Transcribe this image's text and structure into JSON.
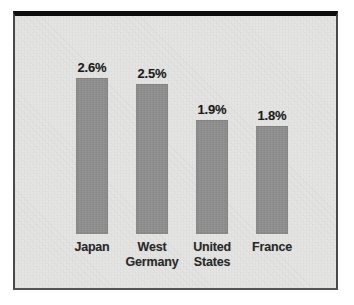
{
  "chart_data": {
    "type": "bar",
    "title": "",
    "subtitle": "",
    "xlabel": "",
    "ylabel": "",
    "grid": false,
    "legend": "none",
    "ylim": [
      0,
      3.0
    ],
    "categories": [
      "Japan",
      "West Germany",
      "United States",
      "France"
    ],
    "category_lines": [
      [
        "Japan"
      ],
      [
        "West",
        "Germany"
      ],
      [
        "United",
        "States"
      ],
      [
        "France"
      ]
    ],
    "values": [
      2.6,
      2.5,
      1.9,
      1.8
    ],
    "value_labels": [
      "2.6%",
      "2.5%",
      "1.9%",
      "1.8%"
    ],
    "bar_color": "#8f8f8f",
    "background_color": "#f3f3f1",
    "frame_color": "#0d0d0d",
    "text_color": "#1d1d1d"
  }
}
